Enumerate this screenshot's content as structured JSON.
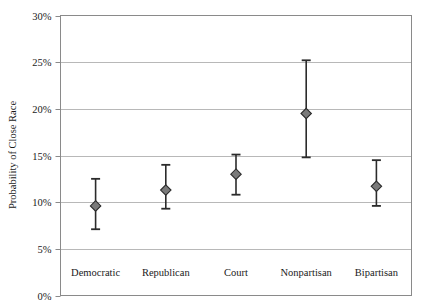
{
  "chart_data": {
    "type": "scatter",
    "title": "",
    "subtitle": "",
    "xlabel": "",
    "ylabel": "Probability of Close Race",
    "categories": [
      "Democratic",
      "Republican",
      "Court",
      "Nonpartisan",
      "Bipartisan"
    ],
    "values": [
      9.6,
      11.3,
      13.0,
      19.5,
      11.7
    ],
    "error_low": [
      7.1,
      9.3,
      10.8,
      14.8,
      9.6
    ],
    "error_high": [
      12.5,
      14.0,
      15.1,
      25.2,
      14.5
    ],
    "ylim": [
      0,
      30
    ],
    "yticks": [
      0,
      5,
      10,
      15,
      20,
      25,
      30
    ],
    "ytick_labels": [
      "0%",
      "5%",
      "10%",
      "15%",
      "20%",
      "25%",
      "30%"
    ],
    "grid": true,
    "grid_axis": "y",
    "legend": false,
    "legend_position": "none",
    "marker": "diamond",
    "series": [
      {
        "name": "Probability of Close Race",
        "points": [
          {
            "category": "Democratic",
            "value": 9.6,
            "low": 7.1,
            "high": 12.5
          },
          {
            "category": "Republican",
            "value": 11.3,
            "low": 9.3,
            "high": 14.0
          },
          {
            "category": "Court",
            "value": 13.0,
            "low": 10.8,
            "high": 15.1
          },
          {
            "category": "Nonpartisan",
            "value": 19.5,
            "low": 14.8,
            "high": 25.2
          },
          {
            "category": "Bipartisan",
            "value": 11.7,
            "low": 9.6,
            "high": 14.5
          }
        ]
      }
    ]
  },
  "colors": {
    "background": "#ffffff",
    "plot_background": "#ffffff",
    "grid": "#b8b8b8",
    "axis": "#8a8a8a",
    "marker_fill": "#7a7a7a",
    "marker_stroke": "#2b2b2b",
    "error_bar": "#2b2b2b",
    "text": "#1a1a1a"
  },
  "axes": {
    "y_label": "Probability of Close Race",
    "y_ticks": [
      "30%",
      "25%",
      "20%",
      "15%",
      "10%",
      "5%",
      "0%"
    ]
  }
}
